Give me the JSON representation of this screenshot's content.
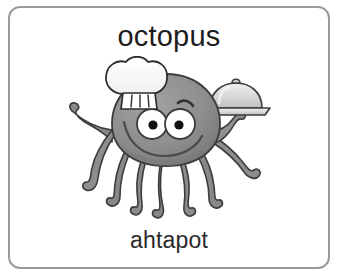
{
  "card": {
    "title": "octopus",
    "subtitle": "ahtapot",
    "border_color": "#9a9a9a",
    "background_color": "#ffffff",
    "title_color": "#1d1d1d",
    "subtitle_color": "#2a2a2a"
  },
  "illustration": {
    "name": "octopus-chef-illustration",
    "description": "Gray cartoon octopus wearing a white chef hat, smiling, holding a covered serving tray with one tentacle",
    "palette": {
      "body_fill": "#8f8f8f",
      "body_shadow": "#6f6f6f",
      "outline": "#3a3a3a",
      "hat_fill": "#fdfdfd",
      "hat_outline": "#2e2e2e",
      "tray_fill": "#d2d2d2",
      "tray_highlight": "#ededed",
      "eye_white": "#ffffff",
      "pupil": "#111111"
    },
    "parts": [
      {
        "name": "chef-hat",
        "label": "chef hat"
      },
      {
        "name": "octopus-head",
        "label": "head"
      },
      {
        "name": "octopus-eyes",
        "label": "eyes"
      },
      {
        "name": "octopus-mouth",
        "label": "smile"
      },
      {
        "name": "octopus-tentacles",
        "label": "tentacles"
      },
      {
        "name": "serving-tray",
        "label": "covered serving tray"
      }
    ]
  }
}
